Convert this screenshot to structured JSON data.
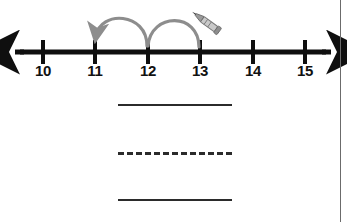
{
  "worksheet": {
    "title": "Number line subtraction jumps",
    "numberline": {
      "name": "number-line",
      "ticks": [
        {
          "label": "10",
          "value": 10,
          "x": 43
        },
        {
          "label": "11",
          "value": 11,
          "x": 95
        },
        {
          "label": "12",
          "value": 12,
          "x": 148
        },
        {
          "label": "13",
          "value": 13,
          "x": 200
        },
        {
          "label": "14",
          "value": 14,
          "x": 253
        },
        {
          "label": "15",
          "value": 15,
          "x": 305
        }
      ],
      "axis": {
        "y": 52,
        "left_arrow_x": 14,
        "right_arrow_x": 332,
        "color": "#0f0f0f",
        "thickness": 5,
        "left_arrow": "arrow-left",
        "right_arrow": "arrow-right"
      },
      "jumps": [
        {
          "name": "jump-arc-1",
          "from": 12,
          "to": 11,
          "direction": "left",
          "arrowhead": true,
          "color": "#8d8d8d"
        },
        {
          "name": "jump-arc-2",
          "from": 13,
          "to": 12,
          "direction": "left",
          "arrowhead": false,
          "color": "#8d8d8d"
        }
      ],
      "annotation_icon": {
        "name": "pencil-icon",
        "x": 212,
        "y": 24,
        "color": "#6e6e6e"
      }
    },
    "answer_lines": [
      {
        "name": "answer-line-1",
        "style": "solid",
        "y": 104,
        "value": ""
      },
      {
        "name": "answer-line-2",
        "style": "dashed",
        "y": 153,
        "value": ""
      },
      {
        "name": "answer-line-3",
        "style": "solid",
        "y": 200,
        "value": ""
      }
    ],
    "colors": {
      "ink": "#0f0f0f",
      "arc": "#8d8d8d",
      "rule": "#2b2b2b",
      "border": "#6b6b6b",
      "background": "#ffffff"
    }
  }
}
